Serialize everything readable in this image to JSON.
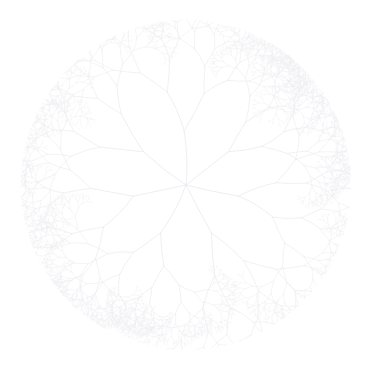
{
  "figure": {
    "type": "fractal-line-drawing",
    "alt_text": "A pale gray recursive binary branching tree arranged radially, filling a circular disc on a white background",
    "width": 377,
    "height": 369
  },
  "canvas": {
    "background_color": "#ffffff",
    "width": 377,
    "height": 369
  },
  "chart_data": {
    "type": "line",
    "title": "",
    "subtitle": "",
    "xlabel": "",
    "ylabel": "",
    "grid": false,
    "legend": null,
    "axes_visible": false,
    "tick_labels": [],
    "annotations": [],
    "render_mode": "recursive-fractal",
    "geometry": {
      "center_x": 186,
      "center_y": 185,
      "disc_radius": 165,
      "bounding_box": {
        "left": 22,
        "top": 30,
        "right": 353,
        "bottom": 350
      }
    },
    "fractal_params": {
      "root_count": 7,
      "root_angles_deg": [
        -92,
        -38,
        12,
        62,
        118,
        168,
        218
      ],
      "initial_length": 54,
      "length_ratio": 0.735,
      "branch_angle_deg": 27,
      "angle_jitter_deg": 7.5,
      "length_jitter": 0.16,
      "max_depth": 10,
      "children_per_node": 2,
      "stroke_color": "#e6e6ec",
      "stroke_color_tip": "#efeff3",
      "stroke_width_base": 0.7,
      "stroke_width_tip": 0.32,
      "curvature": 0.18,
      "random_seed": 20240517
    },
    "series": [
      {
        "name": "branches",
        "description": "All recursive line segments of the fractal tree",
        "approx_segment_count": 14329
      }
    ]
  },
  "overlays": {
    "labels": [],
    "watermark": null
  }
}
